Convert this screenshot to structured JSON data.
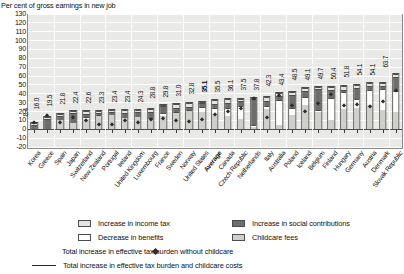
{
  "header": {
    "cut_title": "Figure 3.5. Increase in effective tax burden, with and without childcare costs",
    "subtitle": "Per cent of gross earnings in new job"
  },
  "chart_data": {
    "type": "bar",
    "stacked": true,
    "title": "Increase in effective tax burden, with and without childcare costs",
    "xlabel": "",
    "ylabel": "Per cent of gross earnings in new job",
    "ylim": [
      -20,
      130
    ],
    "ytick_labels": [
      "130",
      "120",
      "110",
      "100",
      "90",
      "80",
      "70",
      "60",
      "50",
      "40",
      "30",
      "20",
      "10",
      "0",
      "-10",
      "-20"
    ],
    "grid": true,
    "legend_position": "bottom",
    "categories": [
      "Korea",
      "Greece",
      "Spain",
      "Japan",
      "Switzerland",
      "New Zealand",
      "Portugal",
      "Ireland",
      "United Kingdom",
      "Luxembourg",
      "France",
      "Sweden",
      "Norway",
      "United States",
      "Average",
      "Canada",
      "Czech Republic",
      "Netherlands",
      "Italy",
      "Australia",
      "Poland",
      "Iceland",
      "Belgium",
      "Finland",
      "Hungary",
      "Germany",
      "Austria",
      "Denmark",
      "Slovak Republic"
    ],
    "total_labels": [
      "8.4",
      "16.0",
      "19.5",
      "21.8",
      "22.4",
      "22.6",
      "23.3",
      "23.4",
      "23.4",
      "24.3",
      "28.8",
      "29.8",
      "31.0",
      "32.8",
      "35.1",
      "35.5",
      "36.1",
      "37.5",
      "37.8",
      "42.3",
      "43.4",
      "48.5",
      "49.1",
      "49.7",
      "50.4",
      "51.8",
      "54.1",
      "54.1",
      "63.7"
    ],
    "totals": [
      8.4,
      16.0,
      19.5,
      21.8,
      22.4,
      22.6,
      23.3,
      23.4,
      23.4,
      24.3,
      28.8,
      29.8,
      31.0,
      32.8,
      35.1,
      35.5,
      36.1,
      37.5,
      37.8,
      42.3,
      43.4,
      48.5,
      49.1,
      49.7,
      50.4,
      51.8,
      54.1,
      54.1,
      63.7
    ],
    "series": [
      {
        "name": "Childcare fees",
        "color": "#cfcfcb",
        "values": [
          0.0,
          0.0,
          11.0,
          8.0,
          12.0,
          17.0,
          17.0,
          13.0,
          15.0,
          13.0,
          16.0,
          20.0,
          22.0,
          21.0,
          18.0,
          15.0,
          12.0,
          2.0,
          24.0,
          4.0,
          16.0,
          28.0,
          20.0,
          10.0,
          23.0,
          24.0,
          28.0,
          22.0,
          20.0
        ]
      },
      {
        "name": "Decrease in benefits",
        "color": "#ffffff",
        "values": [
          0.0,
          0.0,
          0.0,
          0.0,
          2.5,
          1.0,
          0.0,
          0.0,
          0.0,
          1.0,
          3.0,
          1.0,
          1.0,
          5.0,
          7.0,
          10.0,
          15.0,
          2.0,
          4.0,
          31.0,
          9.0,
          10.0,
          2.0,
          27.0,
          20.0,
          11.0,
          18.0,
          25.0,
          24.0
        ]
      },
      {
        "name": "Increase in social contributions",
        "color": "#6d6d6b",
        "values": [
          5.4,
          13.0,
          5.5,
          11.8,
          4.0,
          2.0,
          4.3,
          7.4,
          6.4,
          7.3,
          8.8,
          4.8,
          4.0,
          4.8,
          5.1,
          5.5,
          6.1,
          31.5,
          5.8,
          4.3,
          15.4,
          6.5,
          25.1,
          8.7,
          3.4,
          12.8,
          4.1,
          3.1,
          16.7
        ]
      },
      {
        "name": "Increase in income tax",
        "color": "#e4e4e0",
        "values": [
          3.0,
          3.0,
          3.0,
          2.0,
          3.9,
          2.6,
          2.0,
          3.0,
          2.0,
          3.0,
          1.0,
          4.0,
          4.0,
          2.0,
          5.0,
          5.0,
          3.0,
          2.0,
          4.0,
          3.0,
          3.0,
          4.0,
          2.0,
          4.0,
          4.0,
          4.0,
          4.0,
          4.0,
          3.0
        ]
      }
    ]
  },
  "legend": {
    "items": [
      {
        "label": "Increase in income tax",
        "swatch": "income"
      },
      {
        "label": "Increase in social contributions",
        "swatch": "social"
      },
      {
        "label": "Decrease in benefits",
        "swatch": "benefits"
      },
      {
        "label": "Childcare fees",
        "swatch": "childcare"
      },
      {
        "label": "Total increase in effective tax burden without childcare",
        "swatch": "diamond"
      },
      {
        "label": "Total increase in effective tax burden and childcare costs",
        "swatch": "line"
      }
    ]
  }
}
